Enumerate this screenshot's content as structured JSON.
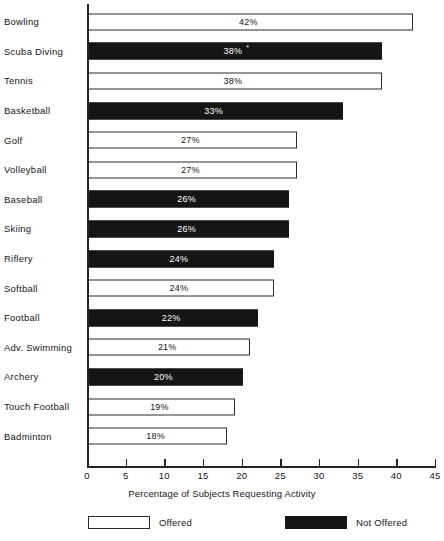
{
  "chart_data": {
    "type": "bar",
    "orientation": "horizontal",
    "title": "",
    "xlabel": "Percentage of Subjects Requesting Activity",
    "ylabel": "",
    "xlim": [
      0,
      45
    ],
    "xticks": [
      0,
      5,
      10,
      15,
      20,
      25,
      30,
      35,
      40,
      45
    ],
    "xtick_labels": [
      "0",
      "5",
      "10",
      "15",
      "20",
      "25",
      "30",
      "35",
      "40",
      "45"
    ],
    "grid": false,
    "legend_position": "bottom",
    "categories": [
      "Bowling",
      "Scuba Diving",
      "Tennis",
      "Basketball",
      "Golf",
      "Volleyball",
      "Baseball",
      "Skiing",
      "Riflery",
      "Softball",
      "Football",
      "Adv. Swimming",
      "Archery",
      "Touch Football",
      "Badminton"
    ],
    "values": [
      42,
      38,
      38,
      33,
      27,
      27,
      26,
      26,
      24,
      24,
      22,
      21,
      20,
      19,
      18
    ],
    "value_labels": [
      "42%",
      "38%",
      "38%",
      "33%",
      "27%",
      "27%",
      "26%",
      "26%",
      "24%",
      "24%",
      "22%",
      "21%",
      "20%",
      "19%",
      "18%"
    ],
    "series_of_bar": [
      "Offered",
      "Not Offered",
      "Offered",
      "Not Offered",
      "Offered",
      "Offered",
      "Not Offered",
      "Not Offered",
      "Not Offered",
      "Offered",
      "Not Offered",
      "Offered",
      "Not Offered",
      "Offered",
      "Offered"
    ],
    "annotations": [
      {
        "category": "Scuba Diving",
        "mark": "*"
      }
    ],
    "legend": [
      {
        "label": "Offered",
        "color": "#ffffff"
      },
      {
        "label": "Not Offered",
        "color": "#151515"
      }
    ],
    "colors": {
      "offered": "#ffffff",
      "not_offered": "#151515",
      "axis": "#232323",
      "text": "#161616"
    }
  }
}
